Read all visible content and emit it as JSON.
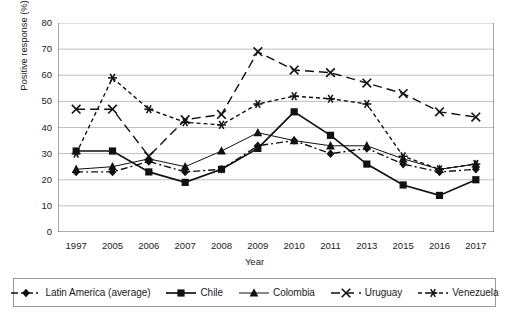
{
  "chart_data": {
    "type": "line",
    "title": "",
    "xlabel": "Year",
    "ylabel": "Positive response (%)",
    "categories": [
      "1997",
      "2005",
      "2006",
      "2007",
      "2008",
      "2009",
      "2010",
      "2011",
      "2013",
      "2015",
      "2016",
      "2017"
    ],
    "ylim": [
      0,
      80
    ],
    "yticks": [
      0,
      10,
      20,
      30,
      40,
      50,
      60,
      70,
      80
    ],
    "grid": "horizontal",
    "legend_position": "bottom",
    "series": [
      {
        "name": "Latin America (average)",
        "marker": "diamond",
        "dash": "dash-dot",
        "values": [
          23,
          23,
          27,
          23,
          24,
          33,
          35,
          30,
          32,
          26,
          23,
          24
        ]
      },
      {
        "name": "Chile",
        "marker": "square",
        "dash": "solid",
        "values": [
          31,
          31,
          23,
          19,
          24,
          32,
          46,
          37,
          26,
          18,
          14,
          20
        ]
      },
      {
        "name": "Colombia",
        "marker": "triangle",
        "dash": "solid-thin",
        "values": [
          24,
          25,
          28,
          25,
          31,
          38,
          35,
          33,
          33,
          28,
          24,
          26
        ]
      },
      {
        "name": "Uruguay",
        "marker": "cross",
        "dash": "long-dash",
        "values": [
          47,
          47,
          29,
          43,
          45,
          69,
          62,
          61,
          57,
          53,
          46,
          44
        ]
      },
      {
        "name": "Venezuela",
        "marker": "asterisk",
        "dash": "short-dash",
        "values": [
          30,
          59,
          47,
          42,
          41,
          49,
          52,
          51,
          49,
          29,
          24,
          26
        ]
      }
    ]
  },
  "axis": {
    "yticks": [
      "0",
      "10",
      "20",
      "30",
      "40",
      "50",
      "60",
      "70",
      "80"
    ],
    "xticks": [
      "1997",
      "2005",
      "2006",
      "2007",
      "2008",
      "2009",
      "2010",
      "2011",
      "2013",
      "2015",
      "2016",
      "2017"
    ],
    "xlabel": "Year",
    "ylabel": "Positive response (%)"
  },
  "legend": {
    "items": [
      {
        "label": "Latin America (average)",
        "marker": "diamond-marker-icon"
      },
      {
        "label": "Chile",
        "marker": "square-marker-icon"
      },
      {
        "label": "Colombia",
        "marker": "triangle-marker-icon"
      },
      {
        "label": "Uruguay",
        "marker": "cross-marker-icon"
      },
      {
        "label": "Venezuela",
        "marker": "asterisk-marker-icon"
      }
    ]
  },
  "colors": {
    "line": "#111111",
    "grid": "#b8b8b8",
    "axis": "#555555",
    "legend_border": "#9a9a9a",
    "background": "#ffffff"
  }
}
